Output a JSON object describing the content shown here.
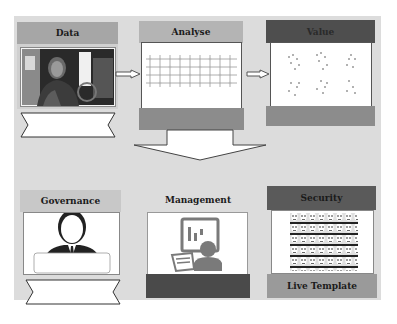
{
  "stages": {
    "data": {
      "title": "Data",
      "image": "person-photo"
    },
    "analyse": {
      "title": "Analyse",
      "image": "grid-network"
    },
    "value": {
      "title": "Value",
      "image": "scatter-clusters"
    },
    "governance": {
      "title": "Governance",
      "image": "businessman-icon"
    },
    "management": {
      "title": "Management",
      "image": "presentation-user-icon"
    },
    "security": {
      "title": "Security",
      "image": "face-template-mosaic",
      "footer": "Live Template"
    }
  },
  "colors": {
    "background": "#dcdcdc",
    "header_light": "#a9a9a9",
    "header_dark": "#555555",
    "footer_mid": "#8c8c8c",
    "footer_dark": "#4a4a4a",
    "icon_gray": "#7a7a7a"
  }
}
